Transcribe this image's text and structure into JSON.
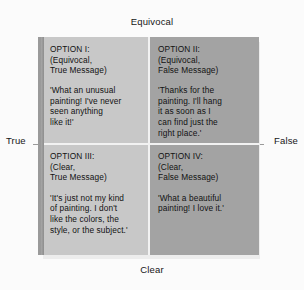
{
  "axes": {
    "top": "Equivocal",
    "bottom": "Clear",
    "left": "True",
    "right": "False"
  },
  "quadrants": [
    {
      "id": "option-1",
      "title": "OPTION I:\n(Equivocal,\nTrue Message)",
      "quote": "'What an unusual\npainting! I've never\nseen anything\nlike it!'",
      "shade": "light",
      "x_axis": "Equivocal",
      "y_axis": "True"
    },
    {
      "id": "option-2",
      "title": "OPTION II:\n(Equivocal,\nFalse Message)",
      "quote": "'Thanks for the\npainting. I'll hang\nit as soon as I\ncan find just the\nright place.'",
      "shade": "dark",
      "x_axis": "Equivocal",
      "y_axis": "False"
    },
    {
      "id": "option-3",
      "title": "OPTION III:\n(Clear,\nTrue Message)",
      "quote": "'It's just not my kind\nof painting. I don't\nlike the colors, the\nstyle, or the subject.'",
      "shade": "light",
      "x_axis": "Clear",
      "y_axis": "True"
    },
    {
      "id": "option-4",
      "title": "OPTION IV:\n(Clear,\nFalse Message)",
      "quote": "'What a beautiful\npainting! I love it.'",
      "shade": "dark",
      "x_axis": "Clear",
      "y_axis": "False"
    }
  ],
  "colors": {
    "background": "#fbfbfb",
    "cell_light": "#c8c8c8",
    "cell_dark": "#a3a3a3",
    "divider": "#f2f2f2",
    "bevel": "#9a9a9a",
    "text": "#121212"
  }
}
